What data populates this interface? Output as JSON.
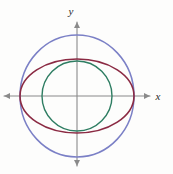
{
  "figure": {
    "background_color": "#fdfdfc",
    "axis_color": "#8a8a8a",
    "axis_label_color": "#2b2b2b",
    "x_axis_label": "x",
    "y_axis_label": "y",
    "origin": {
      "x": 77,
      "y": 96
    },
    "x_axis": {
      "x1": 4,
      "x2": 150,
      "y": 96
    },
    "y_axis": {
      "x": 77,
      "y1": 166,
      "y2": 22
    }
  },
  "chart_data": {
    "type": "scatter",
    "title": "",
    "xlabel": "x",
    "ylabel": "y",
    "grid": false,
    "legend": "none",
    "axis_style": "arrows-both-ends",
    "xlim": [
      -73,
      73
    ],
    "ylim": [
      -74,
      74
    ],
    "origin_px": [
      77,
      96
    ],
    "series": [
      {
        "name": "outer-circle",
        "shape": "circle",
        "color": "#7b80c6",
        "center": [
          0,
          0
        ],
        "radius": 57,
        "semi_axis_x": 57,
        "semi_axis_y": 61,
        "cx_px": 77,
        "cy_px": 96,
        "rx_px": 57,
        "ry_px": 61,
        "stroke_width": 1.5
      },
      {
        "name": "ellipse",
        "shape": "ellipse",
        "color": "#8b2a43",
        "center": [
          0,
          0
        ],
        "semi_axis_x": 57,
        "semi_axis_y": 37,
        "cx_px": 77,
        "cy_px": 96,
        "rx_px": 57,
        "ry_px": 37,
        "stroke_width": 1.6
      },
      {
        "name": "inner-circle",
        "shape": "circle",
        "color": "#2e7d62",
        "center": [
          0,
          0
        ],
        "radius": 35,
        "semi_axis_x": 35,
        "semi_axis_y": 35,
        "cx_px": 77,
        "cy_px": 96,
        "rx_px": 35,
        "ry_px": 35,
        "stroke_width": 1.4
      }
    ],
    "annotations": []
  }
}
